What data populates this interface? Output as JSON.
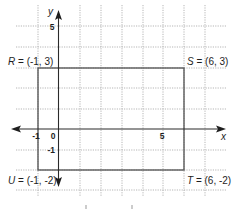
{
  "figure": {
    "type": "coordinate-plane",
    "axes": {
      "x_label": "x",
      "y_label": "y",
      "x_ticks": [
        {
          "value": -1,
          "label": "-1"
        },
        {
          "value": 0,
          "label": "0"
        },
        {
          "value": 5,
          "label": "5"
        }
      ],
      "y_ticks": [
        {
          "value": 5,
          "label": "5"
        },
        {
          "value": -1,
          "label": "-1"
        }
      ],
      "x_range": [
        -2,
        8
      ],
      "y_range": [
        -3,
        6
      ]
    },
    "rectangle": {
      "vertices": [
        {
          "name": "R",
          "x": -1,
          "y": 3,
          "label": "R = (-1, 3)",
          "letter": "R",
          "coords": " = (-1, 3)"
        },
        {
          "name": "S",
          "x": 6,
          "y": 3,
          "label": "S = (6, 3)",
          "letter": "S",
          "coords": " = (6, 3)"
        },
        {
          "name": "T",
          "x": 6,
          "y": -2,
          "label": "T = (6, -2)",
          "letter": "T",
          "coords": " = (6, -2)"
        },
        {
          "name": "U",
          "x": -1,
          "y": -2,
          "label": "U = (-1, -2)",
          "letter": "U",
          "coords": " = (-1, -2)"
        }
      ]
    },
    "colors": {
      "axis": "#2a2a2a",
      "rectangle": "#5a5a5a",
      "grid": "#b5b5b5"
    }
  }
}
